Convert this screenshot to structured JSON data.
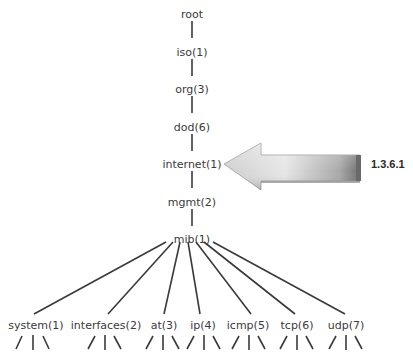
{
  "diagram": {
    "type": "tree",
    "spine": [
      {
        "label": "root",
        "x": 192,
        "y": 14
      },
      {
        "label": "iso(1)",
        "x": 192,
        "y": 52
      },
      {
        "label": "org(3)",
        "x": 192,
        "y": 89
      },
      {
        "label": "dod(6)",
        "x": 192,
        "y": 127
      },
      {
        "label": "internet(1)",
        "x": 192,
        "y": 164
      },
      {
        "label": "mgmt(2)",
        "x": 192,
        "y": 202
      },
      {
        "label": "mib(1)",
        "x": 192,
        "y": 239
      }
    ],
    "children": [
      {
        "label": "system(1)",
        "x": 36,
        "y": 329,
        "from_x": 166,
        "to_x": 34
      },
      {
        "label": "interfaces(2)",
        "x": 106,
        "y": 329,
        "from_x": 173,
        "to_x": 108
      },
      {
        "label": "at(3)",
        "x": 164,
        "y": 329,
        "from_x": 180,
        "to_x": 164
      },
      {
        "label": "ip(4)",
        "x": 203,
        "y": 329,
        "from_x": 188,
        "to_x": 200
      },
      {
        "label": "icmp(5)",
        "x": 248,
        "y": 329,
        "from_x": 196,
        "to_x": 251
      },
      {
        "label": "tcp(6)",
        "x": 297,
        "y": 329,
        "from_x": 204,
        "to_x": 295
      },
      {
        "label": "udp(7)",
        "x": 346,
        "y": 329,
        "from_x": 213,
        "to_x": 345
      }
    ],
    "callout": {
      "label": "1.3.6.1",
      "points_to": "internet(1)",
      "arrow_color_light": "#d8d8d8",
      "arrow_color_dark": "#8a8a8a"
    }
  }
}
